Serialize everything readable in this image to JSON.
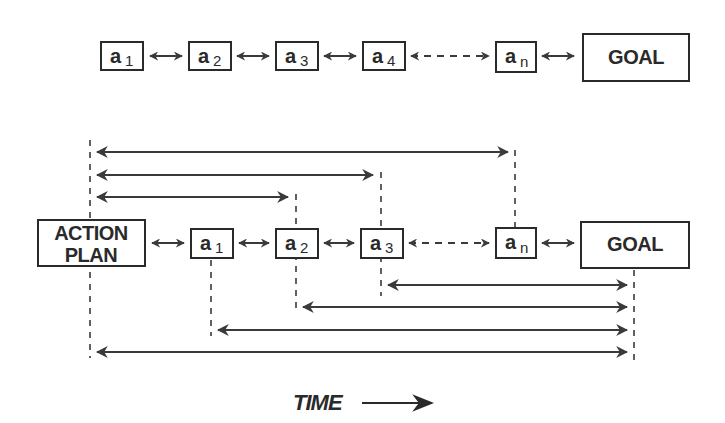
{
  "top_row": {
    "actions": [
      {
        "letter": "a",
        "sub": "1"
      },
      {
        "letter": "a",
        "sub": "2"
      },
      {
        "letter": "a",
        "sub": "3"
      },
      {
        "letter": "a",
        "sub": "4"
      },
      {
        "letter": "a",
        "sub": "n"
      }
    ],
    "goal_label": "GOAL"
  },
  "bottom_row": {
    "plan_label_line1": "ACTION",
    "plan_label_line2": "PLAN",
    "actions": [
      {
        "letter": "a",
        "sub": "1"
      },
      {
        "letter": "a",
        "sub": "2"
      },
      {
        "letter": "a",
        "sub": "3"
      },
      {
        "letter": "a",
        "sub": "n"
      }
    ],
    "goal_label": "GOAL"
  },
  "time_label": "TIME",
  "colors": {
    "ink": "#2a2a2a",
    "background": "#ffffff"
  }
}
